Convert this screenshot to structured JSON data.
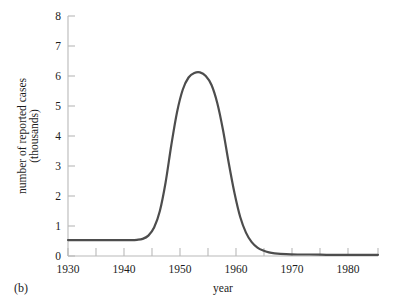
{
  "figure": {
    "panel_label": "(b)",
    "background_color": "#ffffff",
    "curve_color": "#4d4d4d",
    "axis_color": "#b9b9b9"
  },
  "chart_data": {
    "type": "line",
    "title": "",
    "xlabel": "year",
    "ylabel_line1": "number of reported cases",
    "ylabel_line2": "(thousands)",
    "xlim": [
      1930,
      1984
    ],
    "ylim": [
      0,
      8
    ],
    "grid": false,
    "legend": false,
    "x_tick_labels": [
      "1930",
      "1940",
      "1950",
      "1960",
      "1970",
      "1980"
    ],
    "x_tick_label_values": [
      1930,
      1940,
      1950,
      1960,
      1970,
      1980
    ],
    "x_minor_ticks": [
      1935,
      1945,
      1955,
      1965,
      1975
    ],
    "y_tick_labels": [
      "0",
      "1",
      "2",
      "3",
      "4",
      "5",
      "6",
      "7",
      "8"
    ],
    "y_tick_values": [
      0,
      1,
      2,
      3,
      4,
      5,
      6,
      7,
      8
    ],
    "series": [
      {
        "name": "reported cases",
        "x": [
          1930,
          1932,
          1934,
          1936,
          1938,
          1940,
          1941,
          1942,
          1943,
          1944,
          1945,
          1946,
          1947,
          1948,
          1949,
          1950,
          1951,
          1952,
          1953,
          1954,
          1955,
          1956,
          1957,
          1958,
          1959,
          1960,
          1961,
          1962,
          1963,
          1964,
          1965,
          1966,
          1968,
          1970,
          1972,
          1975,
          1978,
          1980,
          1982,
          1984
        ],
        "y": [
          0.53,
          0.53,
          0.53,
          0.53,
          0.53,
          0.53,
          0.53,
          0.54,
          0.57,
          0.68,
          0.95,
          1.5,
          2.45,
          3.7,
          4.8,
          5.55,
          5.95,
          6.1,
          6.12,
          6.0,
          5.7,
          5.1,
          4.2,
          3.1,
          2.1,
          1.3,
          0.78,
          0.46,
          0.28,
          0.18,
          0.12,
          0.09,
          0.06,
          0.05,
          0.05,
          0.04,
          0.04,
          0.04,
          0.04,
          0.04
        ]
      }
    ],
    "peak": {
      "year": 1953,
      "value": 6.1
    },
    "baseline_value": 0.53
  }
}
